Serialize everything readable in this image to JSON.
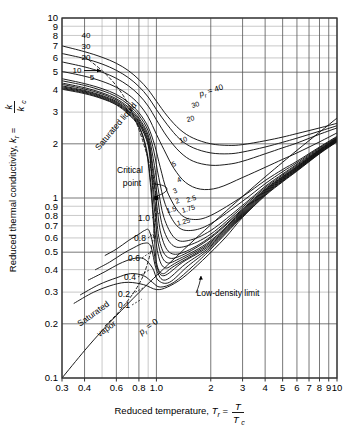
{
  "chart_data": {
    "type": "line",
    "title": "",
    "xlabel": "Reduced temperature, T_r = T / T_c",
    "ylabel": "Reduced thermal conductivity, k_r = k / k_c",
    "xscale": "log",
    "yscale": "log",
    "xlim": [
      0.3,
      10
    ],
    "ylim": [
      0.1,
      10
    ],
    "grid": true,
    "xticks": [
      "0.3",
      "0.4",
      "0.6",
      "0.8",
      "1.0",
      "2",
      "3",
      "4",
      "5",
      "6",
      "7",
      "8",
      "9",
      "10"
    ],
    "xtick_values": [
      0.3,
      0.4,
      0.6,
      0.8,
      1.0,
      2,
      3,
      4,
      5,
      6,
      7,
      8,
      9,
      10
    ],
    "yticks": [
      "0.1",
      "0.2",
      "0.3",
      "0.4",
      "0.5",
      "0.6",
      "0.7",
      "0.8",
      "0.9",
      "1",
      "2",
      "3",
      "4",
      "5",
      "6",
      "7",
      "8",
      "9",
      "10"
    ],
    "ytick_values": [
      0.1,
      0.2,
      0.3,
      0.4,
      0.5,
      0.6,
      0.7,
      0.8,
      0.9,
      1,
      2,
      3,
      4,
      5,
      6,
      7,
      8,
      9,
      10
    ],
    "legend_position": "none",
    "annotations": [
      {
        "id": "saturated-liquid",
        "text": "Saturated liquid",
        "x": 0.52,
        "y": 3.6,
        "rotation": -52
      },
      {
        "id": "saturated-vapor",
        "text": "Saturated vapor",
        "x": 0.4,
        "y": 0.25,
        "rotation": -37
      },
      {
        "id": "critical-point",
        "text": "Critical point",
        "x": 0.55,
        "y": 1.35
      },
      {
        "id": "low-density-limit",
        "text": "Low-density limit",
        "x": 1.75,
        "y": 0.3
      },
      {
        "id": "pr-zero",
        "text": "p_r = 0",
        "x": 0.7,
        "y": 0.205,
        "rotation": -36
      }
    ],
    "series": [
      {
        "name": "p_r = 40",
        "label": "40",
        "left_label": "40",
        "right_label": "p_r = 40",
        "x": [
          0.3,
          0.4,
          0.5,
          0.6,
          0.7,
          0.8,
          0.9,
          1.0,
          1.15,
          1.35,
          1.6,
          2.0,
          2.5,
          3.0,
          4.0,
          5.0,
          6.0,
          8.0,
          10.0
        ],
        "y": [
          7.0,
          6.5,
          6.05,
          5.6,
          5.1,
          4.55,
          4.0,
          3.45,
          2.85,
          2.4,
          2.15,
          2.0,
          1.96,
          1.98,
          2.08,
          2.18,
          2.28,
          2.45,
          2.6
        ]
      },
      {
        "name": "p_r = 30",
        "label": "30",
        "left_label": "30",
        "right_label": "30",
        "x": [
          0.3,
          0.4,
          0.5,
          0.6,
          0.7,
          0.8,
          0.9,
          1.0,
          1.15,
          1.35,
          1.6,
          2.0,
          2.5,
          3.0,
          4.0,
          5.0,
          6.0,
          8.0,
          10.0
        ],
        "y": [
          6.35,
          5.95,
          5.55,
          5.12,
          4.66,
          4.16,
          3.64,
          3.1,
          2.55,
          2.12,
          1.9,
          1.78,
          1.76,
          1.8,
          1.92,
          2.04,
          2.15,
          2.35,
          2.52
        ]
      },
      {
        "name": "p_r = 20",
        "label": "20",
        "left_label": "20",
        "right_label": "20",
        "x": [
          0.3,
          0.4,
          0.5,
          0.6,
          0.7,
          0.8,
          0.9,
          1.0,
          1.15,
          1.35,
          1.6,
          2.0,
          2.5,
          3.0,
          4.0,
          5.0,
          6.0,
          8.0,
          10.0
        ],
        "y": [
          5.7,
          5.35,
          5.0,
          4.62,
          4.2,
          3.74,
          3.24,
          2.72,
          2.18,
          1.8,
          1.6,
          1.52,
          1.54,
          1.6,
          1.76,
          1.9,
          2.02,
          2.26,
          2.45
        ]
      },
      {
        "name": "p_r = 10",
        "label": "10",
        "left_label": "10",
        "right_label": "10",
        "x": [
          0.3,
          0.4,
          0.5,
          0.6,
          0.7,
          0.8,
          0.9,
          1.0,
          1.1,
          1.25,
          1.45,
          1.75,
          2.2,
          3.0,
          4.0,
          5.0,
          6.0,
          8.0,
          10.0
        ],
        "y": [
          5.05,
          4.75,
          4.45,
          4.12,
          3.75,
          3.32,
          2.82,
          2.26,
          1.86,
          1.46,
          1.22,
          1.12,
          1.14,
          1.3,
          1.48,
          1.64,
          1.78,
          2.05,
          2.3
        ]
      },
      {
        "name": "p_r = 5",
        "label": "5",
        "left_label": "5",
        "right_label": "5",
        "x": [
          0.3,
          0.4,
          0.5,
          0.6,
          0.7,
          0.8,
          0.9,
          0.98,
          1.05,
          1.15,
          1.35,
          1.6,
          2.0,
          3.0,
          4.0,
          5.0,
          6.0,
          8.0,
          10.0
        ],
        "y": [
          4.6,
          4.32,
          4.05,
          3.76,
          3.4,
          2.98,
          2.48,
          1.95,
          1.48,
          1.08,
          0.82,
          0.76,
          0.8,
          1.02,
          1.25,
          1.44,
          1.6,
          1.92,
          2.2
        ]
      },
      {
        "name": "p_r = 4",
        "label": "4",
        "left_label": "",
        "right_label": "4",
        "x": [
          0.3,
          0.4,
          0.5,
          0.6,
          0.7,
          0.8,
          0.9,
          0.97,
          1.03,
          1.12,
          1.3,
          1.55,
          2.0,
          3.0,
          4.0,
          5.0,
          6.0,
          8.0,
          10.0
        ],
        "y": [
          4.48,
          4.22,
          3.95,
          3.66,
          3.3,
          2.88,
          2.36,
          1.8,
          1.3,
          0.92,
          0.7,
          0.66,
          0.72,
          0.96,
          1.2,
          1.4,
          1.57,
          1.9,
          2.18
        ]
      },
      {
        "name": "p_r = 3",
        "label": "3",
        "left_label": "",
        "right_label": "3",
        "x": [
          0.3,
          0.4,
          0.5,
          0.6,
          0.7,
          0.8,
          0.9,
          0.96,
          1.02,
          1.1,
          1.26,
          1.5,
          2.0,
          3.0,
          4.0,
          5.0,
          6.0,
          8.0,
          10.0
        ],
        "y": [
          4.35,
          4.1,
          3.84,
          3.56,
          3.2,
          2.78,
          2.24,
          1.66,
          1.14,
          0.78,
          0.6,
          0.58,
          0.66,
          0.91,
          1.16,
          1.36,
          1.54,
          1.88,
          2.16
        ]
      },
      {
        "name": "p_r = 2.5",
        "label": "2.5",
        "left_label": "",
        "right_label": "2.5",
        "x": [
          0.3,
          0.4,
          0.5,
          0.6,
          0.7,
          0.8,
          0.9,
          0.95,
          1.01,
          1.08,
          1.22,
          1.46,
          2.0,
          3.0,
          4.0,
          5.0,
          6.0,
          8.0,
          10.0
        ],
        "y": [
          4.28,
          4.03,
          3.78,
          3.5,
          3.14,
          2.72,
          2.16,
          1.56,
          1.04,
          0.7,
          0.55,
          0.54,
          0.63,
          0.89,
          1.14,
          1.34,
          1.52,
          1.86,
          2.15
        ]
      },
      {
        "name": "p_r = 2",
        "label": "2",
        "left_label": "",
        "right_label": "2",
        "x": [
          0.3,
          0.4,
          0.5,
          0.6,
          0.7,
          0.8,
          0.9,
          0.95,
          1.0,
          1.06,
          1.18,
          1.42,
          2.0,
          3.0,
          4.0,
          5.0,
          6.0,
          8.0,
          10.0
        ],
        "y": [
          4.2,
          3.96,
          3.71,
          3.44,
          3.08,
          2.66,
          2.08,
          1.46,
          0.95,
          0.63,
          0.5,
          0.5,
          0.61,
          0.87,
          1.12,
          1.32,
          1.5,
          1.85,
          2.14
        ]
      },
      {
        "name": "p_r = 1.75",
        "label": "1.75",
        "left_label": "",
        "right_label": "1.75",
        "x": [
          0.3,
          0.4,
          0.5,
          0.6,
          0.7,
          0.8,
          0.9,
          0.94,
          0.99,
          1.04,
          1.15,
          1.38,
          2.0,
          3.0,
          4.0,
          5.0,
          6.0,
          8.0,
          10.0
        ],
        "y": [
          4.15,
          3.92,
          3.67,
          3.4,
          3.04,
          2.62,
          2.02,
          1.4,
          0.88,
          0.58,
          0.47,
          0.48,
          0.6,
          0.86,
          1.11,
          1.31,
          1.49,
          1.84,
          2.13
        ]
      },
      {
        "name": "p_r = 1.5",
        "label": "1.5",
        "left_label": "",
        "right_label": "1.5",
        "x": [
          0.3,
          0.4,
          0.5,
          0.6,
          0.7,
          0.8,
          0.9,
          0.94,
          0.98,
          1.03,
          1.13,
          1.34,
          2.0,
          3.0,
          4.0,
          5.0,
          6.0,
          8.0,
          10.0
        ],
        "y": [
          4.1,
          3.88,
          3.63,
          3.36,
          3.0,
          2.58,
          1.96,
          1.32,
          0.82,
          0.54,
          0.44,
          0.46,
          0.58,
          0.85,
          1.1,
          1.3,
          1.48,
          1.83,
          2.12
        ]
      },
      {
        "name": "p_r = 1.25",
        "label": "1.25",
        "left_label": "",
        "right_label": "1.25",
        "x": [
          0.3,
          0.4,
          0.5,
          0.6,
          0.7,
          0.8,
          0.88,
          0.93,
          0.97,
          1.02,
          1.11,
          1.3,
          2.0,
          3.0,
          4.0,
          5.0,
          6.0,
          8.0,
          10.0
        ],
        "y": [
          4.06,
          3.84,
          3.59,
          3.32,
          2.96,
          2.52,
          1.88,
          1.22,
          0.74,
          0.49,
          0.41,
          0.44,
          0.57,
          0.84,
          1.09,
          1.29,
          1.47,
          1.82,
          2.11
        ]
      },
      {
        "name": "p_r = 1.0",
        "label": "1.0",
        "left_label": "1.0",
        "right_label": "",
        "x": [
          0.3,
          0.4,
          0.5,
          0.6,
          0.7,
          0.8,
          0.88,
          0.93,
          0.97,
          1.0,
          1.08,
          1.26,
          2.0,
          3.0,
          4.0,
          5.0,
          6.0,
          8.0,
          10.0
        ],
        "y": [
          4.02,
          3.8,
          3.56,
          3.29,
          2.92,
          2.48,
          1.82,
          1.14,
          0.66,
          0.44,
          0.38,
          0.42,
          0.56,
          0.83,
          1.08,
          1.28,
          1.46,
          1.81,
          2.1
        ]
      },
      {
        "name": "p_r = 0.8",
        "label": "0.8",
        "left_label": "0.8",
        "right_label": "",
        "x": [
          0.52,
          0.6,
          0.7,
          0.8,
          0.86,
          0.91,
          0.96,
          1.0,
          1.1,
          1.4,
          2.0,
          3.0,
          4.0,
          5.0,
          6.0,
          8.0,
          10.0
        ],
        "y": [
          0.48,
          0.52,
          0.58,
          0.63,
          0.66,
          0.66,
          0.54,
          0.42,
          0.37,
          0.44,
          0.55,
          0.82,
          1.07,
          1.27,
          1.45,
          1.8,
          2.09
        ]
      },
      {
        "name": "p_r = 0.6",
        "label": "0.6",
        "left_label": "0.6",
        "right_label": "",
        "x": [
          0.46,
          0.55,
          0.65,
          0.75,
          0.85,
          0.93,
          1.0,
          1.12,
          1.45,
          2.0,
          3.0,
          4.0,
          5.0,
          6.0,
          8.0,
          10.0
        ],
        "y": [
          0.4,
          0.44,
          0.49,
          0.53,
          0.56,
          0.54,
          0.4,
          0.35,
          0.43,
          0.54,
          0.81,
          1.06,
          1.26,
          1.44,
          1.79,
          2.08
        ]
      },
      {
        "name": "p_r = 0.4",
        "label": "0.4",
        "left_label": "0.4",
        "right_label": "",
        "x": [
          0.42,
          0.52,
          0.62,
          0.74,
          0.85,
          0.95,
          1.02,
          1.18,
          1.5,
          2.0,
          3.0,
          4.0,
          5.0,
          6.0,
          8.0,
          10.0
        ],
        "y": [
          0.35,
          0.39,
          0.43,
          0.46,
          0.46,
          0.41,
          0.35,
          0.34,
          0.42,
          0.53,
          0.8,
          1.05,
          1.25,
          1.43,
          1.78,
          2.07
        ]
      },
      {
        "name": "p_r = 0.2",
        "label": "0.2",
        "left_label": "0.2",
        "right_label": "",
        "x": [
          0.38,
          0.48,
          0.6,
          0.72,
          0.85,
          0.95,
          1.05,
          1.25,
          1.6,
          2.0,
          3.0,
          4.0,
          5.0,
          6.0,
          8.0,
          10.0
        ],
        "y": [
          0.29,
          0.33,
          0.36,
          0.38,
          0.37,
          0.34,
          0.32,
          0.34,
          0.42,
          0.52,
          0.79,
          1.04,
          1.24,
          1.42,
          1.77,
          2.06
        ]
      },
      {
        "name": "p_r = 0.1",
        "label": "0.1",
        "left_label": "0.1",
        "right_label": "",
        "x": [
          0.35,
          0.45,
          0.58,
          0.7,
          0.85,
          1.0,
          1.15,
          1.4,
          1.8,
          2.4,
          3.0,
          4.0,
          5.0,
          6.0,
          8.0,
          10.0
        ],
        "y": [
          0.26,
          0.3,
          0.33,
          0.34,
          0.33,
          0.31,
          0.32,
          0.36,
          0.45,
          0.6,
          0.78,
          1.03,
          1.23,
          1.41,
          1.76,
          2.05
        ]
      },
      {
        "name": "p_r = 0",
        "label": "0",
        "left_label": "",
        "right_label": "",
        "x": [
          0.3,
          0.4,
          0.5,
          0.6,
          0.8,
          1.0,
          1.5,
          2.0,
          3.0,
          4.0,
          5.0,
          6.0,
          8.0,
          10.0
        ],
        "y": [
          0.1,
          0.142,
          0.183,
          0.222,
          0.298,
          0.37,
          0.545,
          0.71,
          1.02,
          1.31,
          1.58,
          1.84,
          2.32,
          2.78
        ]
      },
      {
        "name": "saturated-liquid-envelope",
        "label": "",
        "left_label": "",
        "right_label": "",
        "dashed": true,
        "x": [
          0.4,
          0.5,
          0.6,
          0.7,
          0.8,
          0.88,
          0.94,
          0.98,
          1.0
        ],
        "y": [
          6.1,
          5.1,
          4.2,
          3.3,
          2.4,
          1.78,
          1.4,
          1.15,
          1.0
        ]
      },
      {
        "name": "saturated-vapor-envelope",
        "label": "",
        "left_label": "",
        "right_label": "",
        "dashed": true,
        "x": [
          0.52,
          0.6,
          0.68,
          0.76,
          0.84,
          0.9,
          0.95,
          0.98,
          1.0
        ],
        "y": [
          0.195,
          0.225,
          0.262,
          0.305,
          0.365,
          0.445,
          0.56,
          0.73,
          1.0
        ]
      }
    ],
    "critical_point": {
      "x": 1.0,
      "y": 1.0
    }
  },
  "axes": {
    "y_title_parts": {
      "main": "Reduced thermal conductivity, ",
      "sym": "k",
      "sub": "r",
      "eq": " = ",
      "num": "k",
      "den": "k",
      "den_sub": "c"
    },
    "x_title_parts": {
      "main": "Reduced temperature, ",
      "sym": "T",
      "sub": "r",
      "eq": " = ",
      "num": "T",
      "den": "T",
      "den_sub": "c"
    }
  },
  "labels": {
    "pr_symbol": "p",
    "pr_sub": "r",
    "pr_eq_40": " = 40"
  }
}
